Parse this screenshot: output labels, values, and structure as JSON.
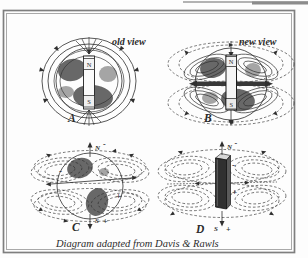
{
  "figure": {
    "caption": "Diagram  adapted from Davis & Rawls",
    "panels": [
      {
        "letter": "A",
        "view_label": "old view",
        "pole_top": "N",
        "pole_bottom": "S"
      },
      {
        "letter": "B",
        "view_label": "new view",
        "pole_top": "N",
        "pole_bottom": "S"
      },
      {
        "letter": "C",
        "pole_top": "N",
        "pole_top_sign": "-",
        "pole_bottom": "S",
        "pole_bottom_sign": "+",
        "field_sign_upper": "-",
        "field_sign_lower": "+"
      },
      {
        "letter": "D",
        "pole_top": "N",
        "pole_top_sign": "-",
        "pole_bottom": "S",
        "pole_bottom_sign": "+",
        "field_sign_upper": "-",
        "field_sign_lower": "+"
      }
    ],
    "colors": {
      "ink": "#2f2f2f",
      "frame_outer": "#7f7f7f",
      "frame_inner": "#a9a9a9",
      "paper": "#fdfdfd"
    }
  }
}
